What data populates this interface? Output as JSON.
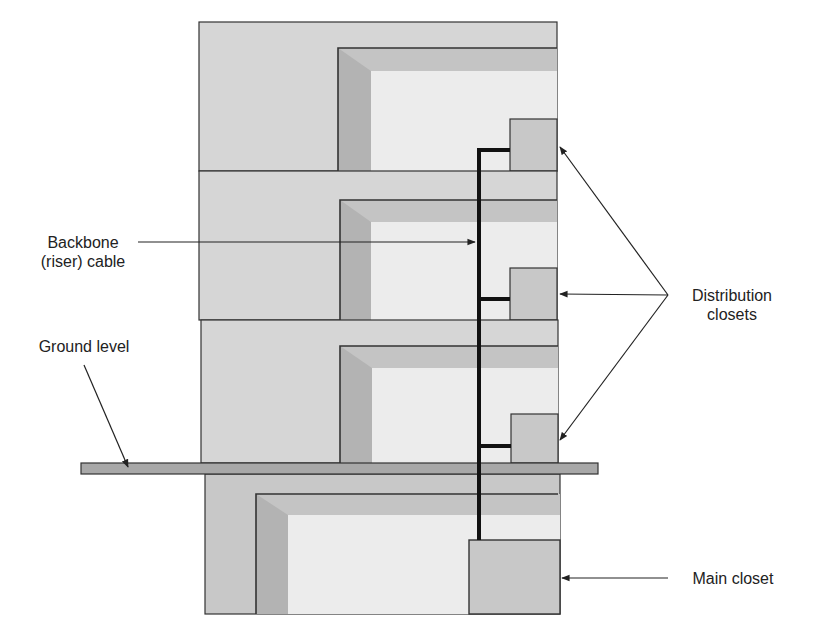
{
  "labels": {
    "backbone_line1": "Backbone",
    "backbone_line2": "(riser) cable",
    "ground_level": "Ground level",
    "distribution_line1": "Distribution",
    "distribution_line2": "closets",
    "main_closet": "Main closet"
  },
  "colors": {
    "wall": "#d6d6d6",
    "ceiling_shade": "#c4c4c4",
    "side_shade": "#b3b3b3",
    "room_light": "#ececec",
    "closet": "#c8c8c8",
    "ground": "#a8a8a8",
    "line": "#333333",
    "cable": "#111111"
  },
  "floors": [
    {
      "name": "floor-3",
      "top": 22,
      "bottom": 171,
      "has_distribution_closet": true
    },
    {
      "name": "floor-2",
      "top": 171,
      "bottom": 320,
      "has_distribution_closet": true
    },
    {
      "name": "floor-1",
      "top": 320,
      "bottom": 463,
      "has_distribution_closet": true
    },
    {
      "name": "basement",
      "top": 474,
      "bottom": 614,
      "has_main_closet": true
    }
  ]
}
